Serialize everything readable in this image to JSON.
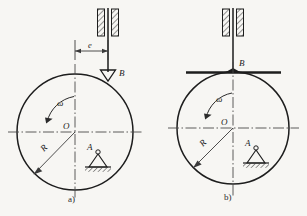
{
  "figure": {
    "kind": "engineering-line-drawing",
    "background_color": "#f7f6f3",
    "ink_color": "#1d1d1d",
    "centerline_color": "#4a4a4a",
    "hatch_color": "#3a3a3a"
  },
  "panels": [
    {
      "id": "a",
      "caption": "a)",
      "follower_type": "knife-edge",
      "circle": {
        "cx": 75,
        "cy": 132,
        "r": 58
      },
      "labels": {
        "center": "O",
        "radius": "R",
        "angular_velocity": "ω",
        "contact_point": "B",
        "support": "A",
        "eccentricity": "e"
      },
      "guide": {
        "x_center": 108,
        "top": 9,
        "bottom": 36,
        "block_width": 7,
        "gap": 5
      },
      "rod": {
        "x": 108,
        "top": 9,
        "bottom": 74
      },
      "dimension_e": {
        "y": 51,
        "x_from": 75,
        "x_to": 108
      },
      "support_A": {
        "x": 98,
        "y": 160
      }
    },
    {
      "id": "b",
      "caption": "b)",
      "follower_type": "flat-face",
      "circle": {
        "cx": 233,
        "cy": 128,
        "r": 56
      },
      "labels": {
        "center": "O",
        "radius": "R",
        "angular_velocity": "ω",
        "contact_point": "B",
        "support": "A"
      },
      "guide": {
        "x_center": 233,
        "top": 9,
        "bottom": 36,
        "block_width": 7,
        "gap": 5
      },
      "rod": {
        "x": 233,
        "top": 9,
        "bottom": 72
      },
      "flat_face": {
        "y": 72,
        "x_from": 186,
        "x_to": 281
      },
      "support_A": {
        "x": 256,
        "y": 156
      }
    }
  ],
  "captions": {
    "a": "a)",
    "b": "b)"
  },
  "text_tokens": {
    "omega": "ω",
    "O": "O",
    "R": "R",
    "B": "B",
    "A": "A",
    "e": "e"
  }
}
